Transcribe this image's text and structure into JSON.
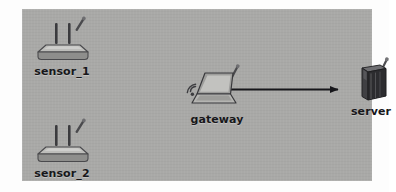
{
  "diagram": {
    "background_color": "#a9a9a7",
    "page_background": "#ffffff",
    "stroke_color": "#1d1d1f",
    "nodes": [
      {
        "id": "sensor_1",
        "label": "sensor_1",
        "icon": "wireless-router-icon",
        "kind": "sensor"
      },
      {
        "id": "sensor_2",
        "label": "sensor_2",
        "icon": "wireless-router-icon",
        "kind": "sensor"
      },
      {
        "id": "gateway",
        "label": "gateway",
        "icon": "wireless-laptop-icon",
        "kind": "gateway"
      },
      {
        "id": "server",
        "label": "server",
        "icon": "server-tower-icon",
        "kind": "server"
      }
    ],
    "links": [
      {
        "id": "gateway-to-server",
        "from": "gateway",
        "to": "server",
        "style": "solid-arrow",
        "label": ""
      }
    ]
  }
}
